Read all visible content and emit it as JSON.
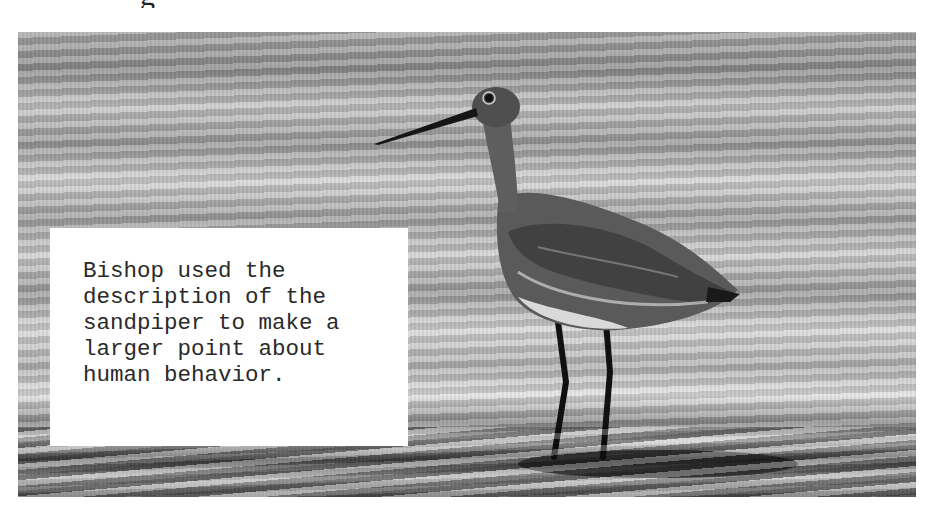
{
  "page": {
    "clipped_heading": "g",
    "photo": {
      "subject": "sandpiper-photo",
      "tone": "grayscale"
    },
    "caption": {
      "text": "Bishop used the\ndescription of the\nsandpiper to make a\nlarger point about\nhuman behavior."
    }
  }
}
